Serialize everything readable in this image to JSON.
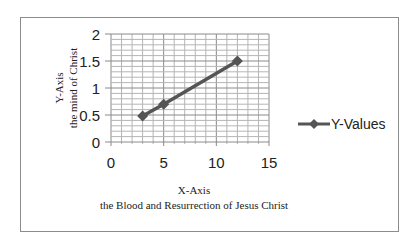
{
  "chart_data": {
    "type": "scatter",
    "title": "",
    "series": [
      {
        "name": "Y-Values",
        "x": [
          3,
          5,
          12
        ],
        "values": [
          0.48,
          0.7,
          1.5
        ],
        "color": "#555555",
        "marker": "diamond",
        "line": true
      }
    ],
    "xlabel": "X-Axis\nthe Blood and Resurrection of Jesus Christ",
    "xlabel_line1": "X-Axis",
    "xlabel_line2": "the Blood and Resurrection of Jesus Christ",
    "ylabel": "Y-Axis\nthe mind of Christ",
    "ylabel_line1": "Y-Axis",
    "ylabel_line2": "the mind of Christ",
    "xlim": [
      0,
      15
    ],
    "ylim": [
      0,
      2
    ],
    "x_ticks": [
      "0",
      "5",
      "10",
      "15"
    ],
    "y_ticks": [
      "0",
      "0.5",
      "1",
      "1.5",
      "2"
    ],
    "grid": true,
    "legend_position": "right",
    "legend_label": "Y-Values"
  }
}
